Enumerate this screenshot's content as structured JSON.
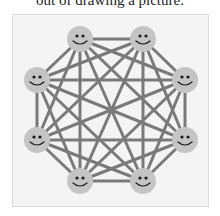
{
  "caption": "out of drawing a picture.",
  "diagram": {
    "type": "complete-graph",
    "node_count": 8,
    "node_icon": "smiley-face-icon",
    "colors": {
      "frame_bg": "#f4f4f4",
      "frame_border": "#dcdcdc",
      "edge": "#7a7a7a",
      "node_fill": "#c4c4c4",
      "node_feature": "#1a1a1a"
    },
    "nodes": [
      {
        "id": "n1",
        "x": 80,
        "y": 39
      },
      {
        "id": "n2",
        "x": 143,
        "y": 39
      },
      {
        "id": "n3",
        "x": 185,
        "y": 80
      },
      {
        "id": "n4",
        "x": 185,
        "y": 140
      },
      {
        "id": "n5",
        "x": 143,
        "y": 181
      },
      {
        "id": "n6",
        "x": 80,
        "y": 181
      },
      {
        "id": "n7",
        "x": 37,
        "y": 140
      },
      {
        "id": "n8",
        "x": 37,
        "y": 80
      }
    ],
    "node_radius": 13,
    "edge_width": 3
  }
}
